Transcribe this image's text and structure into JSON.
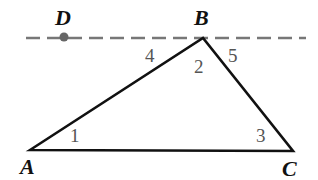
{
  "figure": {
    "type": "geometry-diagram",
    "points": {
      "A": {
        "label": "A",
        "x": 30,
        "y": 150
      },
      "B": {
        "label": "B",
        "x": 203,
        "y": 38
      },
      "C": {
        "label": "C",
        "x": 293,
        "y": 151
      },
      "D": {
        "label": "D",
        "x": 64,
        "y": 37
      }
    },
    "angles": [
      {
        "label": "1",
        "vertex": "A"
      },
      {
        "label": "2",
        "vertex": "B"
      },
      {
        "label": "3",
        "vertex": "C"
      },
      {
        "label": "4",
        "vertex": "B",
        "between": "BD and BA"
      },
      {
        "label": "5",
        "vertex": "B",
        "between": "BC and dashed line"
      }
    ],
    "dashed_line": {
      "through": [
        "D",
        "B"
      ],
      "note": "line through B parallel to AC"
    },
    "colors": {
      "lines": "#111111",
      "dashed": "#777777",
      "angle_labels": "#555555"
    }
  }
}
